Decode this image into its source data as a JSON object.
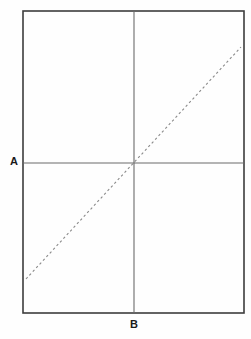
{
  "figure": {
    "background_color": "#fefefe",
    "labels": {
      "a": "A",
      "b": "B"
    },
    "label_color": "#1a1a1a",
    "rectangle": {
      "name": "outer-rectangle",
      "x1": 23,
      "y1": 11,
      "x2": 244,
      "y2": 313,
      "stroke_color": "#3d3d3d",
      "stroke_width": 1.6,
      "fill": "none"
    },
    "horizontal_line": {
      "name": "horizontal-axis-line",
      "label": "A",
      "x1": 23,
      "y1": 163,
      "x2": 244,
      "y2": 163,
      "stroke_color": "#6b6b6b",
      "stroke_width": 1.1
    },
    "vertical_line": {
      "name": "vertical-axis-line",
      "label": "B",
      "x1": 134,
      "y1": 11,
      "x2": 134,
      "y2": 313,
      "stroke_color": "#6b6b6b",
      "stroke_width": 1.1
    },
    "diagonal_line": {
      "name": "dashed-diagonal-line",
      "x1": 26,
      "y1": 279,
      "x2": 241,
      "y2": 47,
      "stroke_color": "#8a8a8a",
      "stroke_width": 1.1,
      "dash_pattern": "2.4 2.6",
      "style": "dashed"
    },
    "intersection_point": {
      "name": "axes-intersection",
      "x": 134,
      "y": 163
    }
  }
}
